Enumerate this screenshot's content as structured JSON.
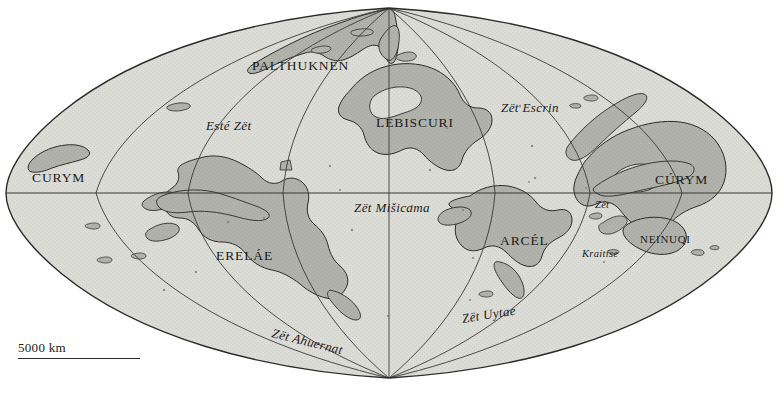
{
  "figure": {
    "kind": "world-map",
    "projection_note": "lens/sinusoidal world projection with polar convergence points",
    "background_color": "#ffffff"
  },
  "colors": {
    "ocean_fill": "#d9d9d4",
    "land_fill": "#b0b0aa",
    "outline": "#2b2b29",
    "graticule": "#3a3a36",
    "label_text": "#1a1a18"
  },
  "scale": {
    "label": "5000 km"
  },
  "labels": {
    "continents": [
      {
        "name": "PALTHUKNEN",
        "x": 252,
        "y": 58,
        "size": "normal"
      },
      {
        "name": "LEBISCURI",
        "x": 376,
        "y": 115,
        "size": "normal"
      },
      {
        "name": "CURYM",
        "x": 32,
        "y": 170,
        "size": "normal"
      },
      {
        "name": "CÚRYM",
        "x": 655,
        "y": 172,
        "size": "normal"
      },
      {
        "name": "ERELÁE",
        "x": 216,
        "y": 248,
        "size": "normal"
      },
      {
        "name": "ARCÉL",
        "x": 500,
        "y": 233,
        "size": "normal"
      },
      {
        "name": "NEINUQI",
        "x": 640,
        "y": 233,
        "size": "small"
      }
    ],
    "oceans": [
      {
        "name": "Esté Zët",
        "x": 206,
        "y": 118,
        "size": "normal",
        "rotate": 0
      },
      {
        "name": "Zët Escrin",
        "x": 501,
        "y": 100,
        "size": "normal",
        "rotate": 0
      },
      {
        "name": "Zët Mišicama",
        "x": 354,
        "y": 200,
        "size": "normal",
        "rotate": 0
      },
      {
        "name": "Zët",
        "x": 595,
        "y": 199,
        "size": "small",
        "rotate": 0
      },
      {
        "name": "Kraitíse",
        "x": 582,
        "y": 248,
        "size": "small",
        "rotate": 0
      },
      {
        "name": "Zët Ahuernat",
        "x": 272,
        "y": 325,
        "size": "normal",
        "rotate": 14
      },
      {
        "name": "Zët Uytae",
        "x": 462,
        "y": 311,
        "size": "normal",
        "rotate": -9
      }
    ]
  }
}
